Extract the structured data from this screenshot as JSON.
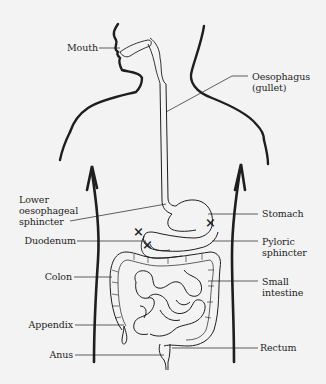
{
  "diagram": {
    "colors": {
      "background": "#f3f3f3",
      "ink": "#1e1e1e"
    },
    "labels_left": [
      {
        "id": "mouth",
        "text": "Mouth"
      },
      {
        "id": "lower-oesophageal-sphincter",
        "line1": "Lower",
        "line2": "oesophageal",
        "line3": "sphincter"
      },
      {
        "id": "duodenum",
        "text": "Duodenum"
      },
      {
        "id": "colon",
        "text": "Colon"
      },
      {
        "id": "appendix",
        "text": "Appendix"
      },
      {
        "id": "anus",
        "text": "Anus"
      }
    ],
    "labels_right": [
      {
        "id": "oesophagus",
        "line1": "Oesophagus",
        "line2": "(gullet)"
      },
      {
        "id": "stomach",
        "text": "Stomach"
      },
      {
        "id": "pyloric-sphincter",
        "line1": "Pyloric",
        "line2": "sphincter"
      },
      {
        "id": "small-intestine",
        "line1": "Small",
        "line2": "intestine"
      },
      {
        "id": "rectum",
        "text": "Rectum"
      }
    ],
    "markers": [
      {
        "id": "marker-lower-oesophageal",
        "symbol": "×"
      },
      {
        "id": "marker-pyloric",
        "symbol": "×"
      },
      {
        "id": "marker-duodenum",
        "symbol": "×"
      }
    ]
  }
}
